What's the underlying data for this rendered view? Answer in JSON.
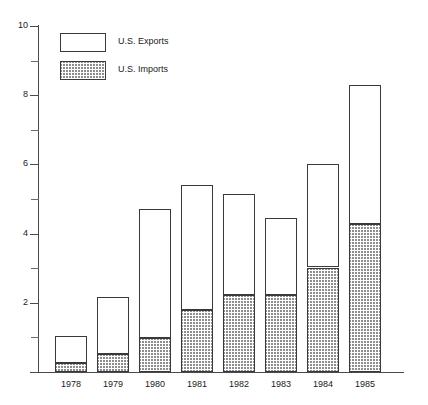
{
  "chart_data": {
    "type": "bar",
    "subtype": "stacked",
    "title": "",
    "xlabel": "",
    "ylabel": "",
    "categories": [
      "1978",
      "1979",
      "1980",
      "1981",
      "1982",
      "1983",
      "1984",
      "1985"
    ],
    "series": [
      {
        "name": "U.S. Imports",
        "fill": "hatched",
        "values": [
          0.25,
          0.52,
          0.98,
          1.8,
          2.22,
          2.22,
          3.02,
          4.28
        ]
      },
      {
        "name": "U.S. Exports",
        "fill": "open",
        "values": [
          0.8,
          1.65,
          3.74,
          3.6,
          2.93,
          2.23,
          2.98,
          4.02
        ]
      }
    ],
    "totals": [
      1.05,
      2.17,
      4.72,
      5.4,
      5.15,
      4.45,
      6.0,
      8.3
    ],
    "ylim": [
      0,
      10
    ],
    "ytick_major": [
      0,
      2,
      4,
      6,
      8,
      10
    ],
    "ytick_major_labels": [
      "",
      "2",
      "4",
      "6",
      "8",
      "10"
    ],
    "ytick_minor": [
      1,
      3,
      5,
      7,
      9
    ],
    "grid": false,
    "legend_position": "top-left",
    "stack_order": [
      "U.S. Imports",
      "U.S. Exports"
    ]
  },
  "legend": {
    "items": [
      {
        "label": "U.S. Exports",
        "style": "open"
      },
      {
        "label": "U.S. Imports",
        "style": "hatched"
      }
    ]
  },
  "colors": {
    "axis": "#4a4a4a",
    "bar_outline": "#3a3a3a",
    "exports_fill": "#ffffff",
    "imports_fill": "#8e8e8e",
    "text": "#1a1a1a",
    "background": "#ffffff"
  }
}
